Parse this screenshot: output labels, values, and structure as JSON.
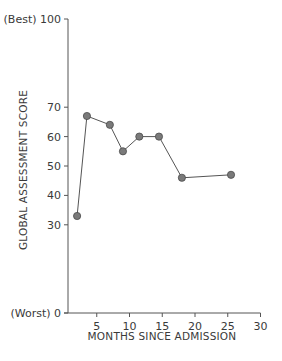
{
  "chart_data": {
    "type": "line",
    "title": "",
    "xlabel": "MONTHS SINCE ADMISSION",
    "ylabel": "GLOBAL ASSESSMENT SCORE",
    "xlim": [
      0,
      30
    ],
    "ylim": [
      0,
      100
    ],
    "x_ticks": [
      5,
      10,
      15,
      20,
      25,
      30
    ],
    "y_ticks": [
      {
        "value": 0,
        "label": "(Worst) 0"
      },
      {
        "value": 30,
        "label": "30"
      },
      {
        "value": 40,
        "label": "40"
      },
      {
        "value": 50,
        "label": "50"
      },
      {
        "value": 60,
        "label": "60"
      },
      {
        "value": 70,
        "label": "70"
      },
      {
        "value": 100,
        "label": "(Best) 100"
      }
    ],
    "grid": false,
    "legend": null,
    "series": [
      {
        "name": "Global assessment score",
        "x": [
          2,
          3.5,
          7,
          9,
          11.5,
          14.5,
          18,
          25.5
        ],
        "y": [
          33,
          67,
          64,
          55,
          60,
          60,
          46,
          47
        ]
      }
    ],
    "colors": {
      "axis": "#555555",
      "line": "#555555",
      "marker": "#7a7a7a",
      "marker_edge": "#4a4a4a"
    }
  }
}
